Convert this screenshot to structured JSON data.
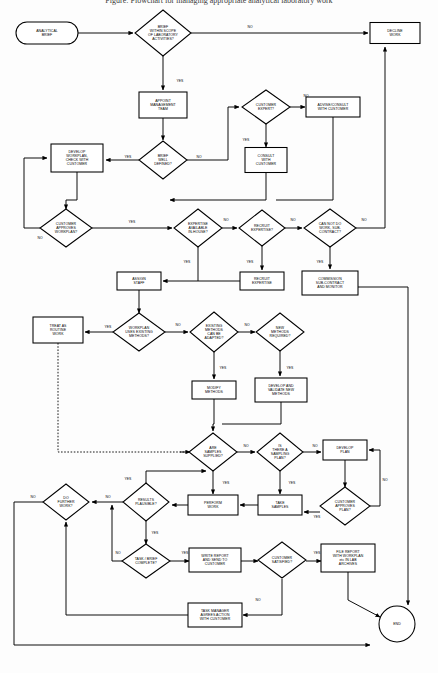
{
  "document": {
    "title_clipped": "Figure: Flowchart for managing appropriate analytical laboratory work"
  },
  "diagram": {
    "type": "flowchart",
    "orientation": "top-down",
    "canvas": {
      "width": 438,
      "height": 673
    },
    "nodes": [
      {
        "id": "analytical-brief",
        "shape": "terminator",
        "label": "ANALYTICAL\nBRIEF",
        "x": 47,
        "y": 33,
        "w": 62,
        "h": 22
      },
      {
        "id": "brief-within-scope",
        "shape": "decision",
        "label": "BRIEF\nWITHIN SCOPE\nOF LABORATORY\nACTIVITIES?",
        "x": 163,
        "y": 33,
        "w": 56,
        "h": 46
      },
      {
        "id": "decline-work",
        "shape": "process",
        "label": "DECLINE\nWORK",
        "x": 395,
        "y": 33,
        "w": 50,
        "h": 21
      },
      {
        "id": "appoint-management",
        "shape": "process",
        "label": "APPOINT\nMANAGEMENT\nTEAM",
        "x": 163,
        "y": 105,
        "w": 48,
        "h": 26
      },
      {
        "id": "customer-expert",
        "shape": "decision",
        "label": "CUSTOMER\nEXPERT?",
        "x": 266,
        "y": 107,
        "w": 48,
        "h": 34
      },
      {
        "id": "advise-consult",
        "shape": "process",
        "label": "ADVISE/CONSULT\nWITH CUSTOMER",
        "x": 333,
        "y": 107,
        "w": 54,
        "h": 20
      },
      {
        "id": "consult-with-customer",
        "shape": "process",
        "label": "CONSULT\nWITH\nCUSTOMER",
        "x": 266,
        "y": 160,
        "w": 42,
        "h": 25
      },
      {
        "id": "brief-well-defined",
        "shape": "decision",
        "label": "BRIEF\nWELL\nDEFINED?",
        "x": 163,
        "y": 160,
        "w": 48,
        "h": 38
      },
      {
        "id": "develop-workplan",
        "shape": "process",
        "label": "DEVELOP\nWORKPLAN,\nCHECK WITH\nCUSTOMER",
        "x": 77,
        "y": 158,
        "w": 52,
        "h": 28
      },
      {
        "id": "customer-approves-wp",
        "shape": "decision",
        "label": "CUSTOMER\nAPPROVES\nWORKPLAN?",
        "x": 66,
        "y": 228,
        "w": 52,
        "h": 38
      },
      {
        "id": "expertise-in-house",
        "shape": "decision",
        "label": "EXPERTISE\nAVAILABLE\nIN-HOUSE?",
        "x": 198,
        "y": 228,
        "w": 48,
        "h": 38
      },
      {
        "id": "recruit-expertise-q",
        "shape": "decision",
        "label": "RECRUIT\nEXPERTISE?",
        "x": 262,
        "y": 228,
        "w": 46,
        "h": 36
      },
      {
        "id": "cannot-do-subcontract",
        "shape": "decision",
        "label": "CAN NOT DO\nWORK, SUB-\nCONTRACT?",
        "x": 330,
        "y": 228,
        "w": 52,
        "h": 38
      },
      {
        "id": "recruit-expertise",
        "shape": "process",
        "label": "RECRUIT\nEXPERTISE",
        "x": 262,
        "y": 281,
        "w": 44,
        "h": 18
      },
      {
        "id": "commission-subcontract",
        "shape": "process",
        "label": "COMMISSION\nSUB-CONTRACT\nAND MONITOR",
        "x": 330,
        "y": 283,
        "w": 56,
        "h": 24
      },
      {
        "id": "assign-staff",
        "shape": "process",
        "label": "ASSIGN\nSTAFF",
        "x": 139,
        "y": 281,
        "w": 44,
        "h": 18
      },
      {
        "id": "workplan-existing",
        "shape": "decision",
        "label": "WORKPLAN\nUSES EXISTING\nMETHODS?",
        "x": 139,
        "y": 332,
        "w": 52,
        "h": 38
      },
      {
        "id": "treat-as-routine",
        "shape": "process",
        "label": "TREAT AS\nROUTINE\nWORK",
        "x": 58,
        "y": 330,
        "w": 50,
        "h": 26
      },
      {
        "id": "existing-adapted",
        "shape": "decision",
        "label": "EXISTING\nMETHODS\nCAN BE\nADAPTED?",
        "x": 214,
        "y": 332,
        "w": 48,
        "h": 40
      },
      {
        "id": "new-methods-required",
        "shape": "decision",
        "label": "NEW\nMETHODS\nREQUIRED?",
        "x": 280,
        "y": 332,
        "w": 48,
        "h": 38
      },
      {
        "id": "modify-methods",
        "shape": "process",
        "label": "MODIFY\nMETHODS",
        "x": 214,
        "y": 390,
        "w": 44,
        "h": 18
      },
      {
        "id": "develop-validate",
        "shape": "process",
        "label": "DEVELOP AND\nVALIDATE NEW\nMETHODS",
        "x": 281,
        "y": 390,
        "w": 52,
        "h": 24
      },
      {
        "id": "are-samples-supplied",
        "shape": "decision",
        "label": "ARE\nSAMPLES\nSUPPLIED?",
        "x": 213,
        "y": 452,
        "w": 48,
        "h": 38
      },
      {
        "id": "is-sampling-plan",
        "shape": "decision",
        "label": "IS\nTHERE A\nSAMPLING\nPLAN?",
        "x": 280,
        "y": 452,
        "w": 46,
        "h": 38
      },
      {
        "id": "develop-plan",
        "shape": "process",
        "label": "DEVELOP\nPLAN",
        "x": 345,
        "y": 450,
        "w": 44,
        "h": 20
      },
      {
        "id": "customer-approves-plan",
        "shape": "decision",
        "label": "CUSTOMER\nAPPROVES\nPLAN?",
        "x": 345,
        "y": 506,
        "w": 50,
        "h": 38
      },
      {
        "id": "take-samples",
        "shape": "process",
        "label": "TAKE\nSAMPLES",
        "x": 280,
        "y": 505,
        "w": 44,
        "h": 20
      },
      {
        "id": "perform-work",
        "shape": "process",
        "label": "PERFORM\nWORK",
        "x": 213,
        "y": 505,
        "w": 50,
        "h": 20
      },
      {
        "id": "results-plausible",
        "shape": "decision",
        "label": "RESULTS\nPLAUSIBLE?",
        "x": 146,
        "y": 502,
        "w": 46,
        "h": 38
      },
      {
        "id": "do-further-work",
        "shape": "decision",
        "label": "DO\nFURTHER\nWORK?",
        "x": 66,
        "y": 502,
        "w": 46,
        "h": 36
      },
      {
        "id": "task-brief-complete",
        "shape": "decision",
        "label": "TASK / BRIEF\nCOMPLETE?",
        "x": 146,
        "y": 561,
        "w": 48,
        "h": 34
      },
      {
        "id": "write-report",
        "shape": "process",
        "label": "WRITE REPORT\nAND SEND TO\nCUSTOMER",
        "x": 215,
        "y": 560,
        "w": 52,
        "h": 24
      },
      {
        "id": "customer-satisfied",
        "shape": "decision",
        "label": "CUSTOMER\nSATISFIED?",
        "x": 282,
        "y": 560,
        "w": 48,
        "h": 36
      },
      {
        "id": "file-report",
        "shape": "process",
        "label": "FILE REPORT\nWITH WORKPLAN\netc IN LAB\nARCHIVES",
        "x": 348,
        "y": 558,
        "w": 54,
        "h": 28
      },
      {
        "id": "task-manager-agrees",
        "shape": "process",
        "label": "TASK MANAGER\nAGREES ACTION\nWITH CUSTOMER",
        "x": 215,
        "y": 615,
        "w": 54,
        "h": 24
      },
      {
        "id": "end",
        "shape": "terminator-circle",
        "label": "END",
        "x": 397,
        "y": 624,
        "w": 36,
        "h": 36
      }
    ],
    "edge_labels": [
      {
        "id": "e-scope-no",
        "text": "NO",
        "x": 250,
        "y": 27
      },
      {
        "id": "e-scope-yes",
        "text": "YES",
        "x": 180,
        "y": 81
      },
      {
        "id": "e-expert-no",
        "text": "NO",
        "x": 306,
        "y": 96
      },
      {
        "id": "e-expert-yes",
        "text": "YES",
        "x": 246,
        "y": 140
      },
      {
        "id": "e-defined-yes",
        "text": "YES",
        "x": 128,
        "y": 157
      },
      {
        "id": "e-defined-no",
        "text": "NO",
        "x": 199,
        "y": 157
      },
      {
        "id": "e-approves-yes",
        "text": "YES",
        "x": 132,
        "y": 222
      },
      {
        "id": "e-approves-no",
        "text": "NO",
        "x": 40,
        "y": 238
      },
      {
        "id": "e-inhouse-no",
        "text": "NO",
        "x": 226,
        "y": 220
      },
      {
        "id": "e-inhouse-yes",
        "text": "YES",
        "x": 187,
        "y": 262
      },
      {
        "id": "e-recruit-no",
        "text": "NO",
        "x": 293,
        "y": 220
      },
      {
        "id": "e-recruit-yes",
        "text": "YES",
        "x": 250,
        "y": 262
      },
      {
        "id": "e-sub-no",
        "text": "NO",
        "x": 364,
        "y": 220
      },
      {
        "id": "e-sub-yes",
        "text": "YES",
        "x": 320,
        "y": 262
      },
      {
        "id": "e-existingmeth-yes",
        "text": "YES",
        "x": 108,
        "y": 327
      },
      {
        "id": "e-existingmeth-no",
        "text": "NO",
        "x": 178,
        "y": 325
      },
      {
        "id": "e-adapted-yes",
        "text": "YES",
        "x": 223,
        "y": 368
      },
      {
        "id": "e-adapted-no",
        "text": "NO",
        "x": 247,
        "y": 325
      },
      {
        "id": "e-new-yes",
        "text": "YES",
        "x": 290,
        "y": 368
      },
      {
        "id": "e-samples-no",
        "text": "NO",
        "x": 246,
        "y": 446
      },
      {
        "id": "e-samples-yes",
        "text": "YES",
        "x": 226,
        "y": 483
      },
      {
        "id": "e-plan-no",
        "text": "NO",
        "x": 315,
        "y": 446
      },
      {
        "id": "e-plan-yes",
        "text": "YES",
        "x": 292,
        "y": 483
      },
      {
        "id": "e-custplan-no",
        "text": "NO",
        "x": 385,
        "y": 480
      },
      {
        "id": "e-custplan-yes",
        "text": "YES",
        "x": 317,
        "y": 517
      },
      {
        "id": "e-results-yes-top",
        "text": "YES",
        "x": 128,
        "y": 479
      },
      {
        "id": "e-results-no",
        "text": "NO",
        "x": 108,
        "y": 497
      },
      {
        "id": "e-results-yes-dn",
        "text": "YES",
        "x": 155,
        "y": 533
      },
      {
        "id": "e-further-no",
        "text": "NO",
        "x": 33,
        "y": 497
      },
      {
        "id": "e-taskbrief-no",
        "text": "NO",
        "x": 118,
        "y": 553
      },
      {
        "id": "e-taskbrief-yes",
        "text": "YES",
        "x": 185,
        "y": 553
      },
      {
        "id": "e-satisfied-yes",
        "text": "YES",
        "x": 317,
        "y": 553
      },
      {
        "id": "e-satisfied-no",
        "text": "NO",
        "x": 258,
        "y": 600
      }
    ]
  }
}
